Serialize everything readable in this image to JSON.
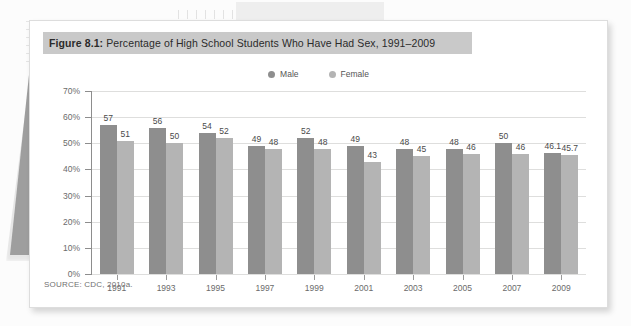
{
  "figure": {
    "label": "Figure 8.1:",
    "title_rest": " Percentage of High School Students Who Have Had Sex, 1991–2009",
    "source_note": "SOURCE: CDC, 2010a."
  },
  "legend": {
    "items": [
      {
        "label": "Male",
        "color": "#8e8e8e",
        "icon": "legend-dot-male"
      },
      {
        "label": "Female",
        "color": "#b4b4b4",
        "icon": "legend-dot-female"
      }
    ]
  },
  "chart_data": {
    "type": "bar",
    "title": "Figure 8.1: Percentage of High School Students Who Have Had Sex, 1991–2009",
    "xlabel": "",
    "ylabel": "",
    "ylim": [
      0,
      70
    ],
    "ytick_labels": [
      "0%",
      "10%",
      "20%",
      "30%",
      "40%",
      "50%",
      "60%",
      "70%"
    ],
    "ytick_values": [
      0,
      10,
      20,
      30,
      40,
      50,
      60,
      70
    ],
    "grid": true,
    "legend_position": "top-center",
    "categories": [
      "1991",
      "1993",
      "1995",
      "1997",
      "1999",
      "2001",
      "2003",
      "2005",
      "2007",
      "2009"
    ],
    "series": [
      {
        "name": "Male",
        "color": "#8e8e8e",
        "values": [
          57,
          56,
          54,
          49,
          52,
          49,
          48,
          48,
          50,
          46.1
        ],
        "labels": [
          "57",
          "56",
          "54",
          "49",
          "52",
          "49",
          "48",
          "48",
          "50",
          "46.1"
        ]
      },
      {
        "name": "Female",
        "color": "#b4b4b4",
        "values": [
          51,
          50,
          52,
          48,
          48,
          43,
          45,
          46,
          46,
          45.7
        ],
        "labels": [
          "51",
          "50",
          "52",
          "48",
          "48",
          "43",
          "45",
          "46",
          "46",
          "45.7"
        ]
      }
    ]
  },
  "colors": {
    "title_band": "#c9c9c9",
    "male_bar": "#8e8e8e",
    "female_bar": "#b4b4b4",
    "gridline": "#dededd",
    "axis": "#8d8d8d"
  }
}
